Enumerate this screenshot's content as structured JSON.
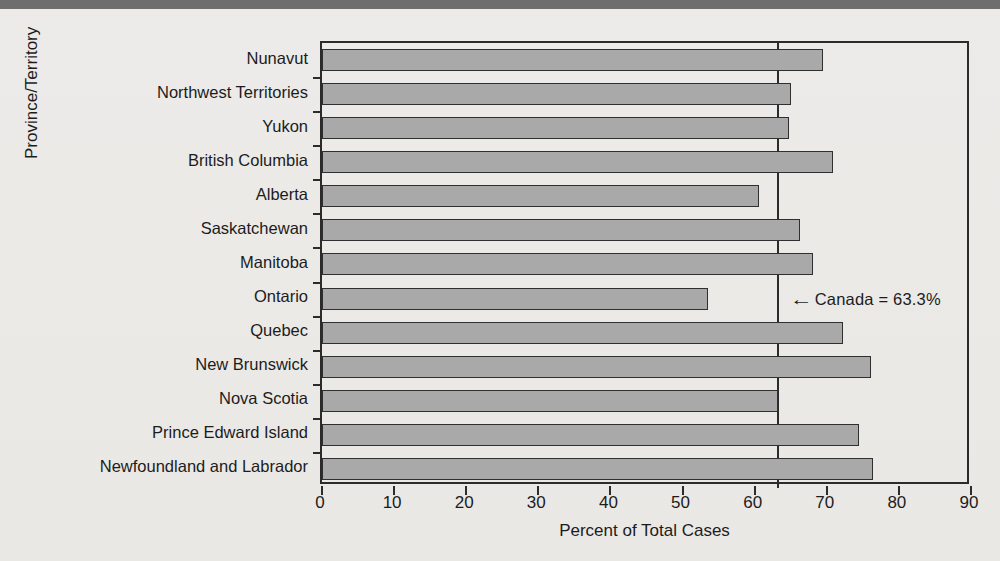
{
  "chart_data": {
    "type": "bar",
    "orientation": "horizontal",
    "title": "",
    "xlabel": "Percent of Total Cases",
    "ylabel": "Province/Territory",
    "xlim": [
      0,
      90
    ],
    "xticks": [
      0,
      10,
      20,
      30,
      40,
      50,
      60,
      70,
      80,
      90
    ],
    "grid": false,
    "legend": null,
    "categories": [
      "Nunavut",
      "Northwest Territories",
      "Yukon",
      "British Columbia",
      "Alberta",
      "Saskatchewan",
      "Manitoba",
      "Ontario",
      "Quebec",
      "New Brunswick",
      "Nova Scotia",
      "Prince Edward Island",
      "Newfoundland and Labrador"
    ],
    "values": [
      69.5,
      65.0,
      64.7,
      70.9,
      60.6,
      66.3,
      68.1,
      53.5,
      72.3,
      76.2,
      63.2,
      74.4,
      76.4
    ],
    "reference_line": {
      "value": 63.3,
      "label": "Canada = 63.3%",
      "arrow": "←"
    },
    "bar_fill_color": "#a9a9a9",
    "bar_edge_color": "#2f2f2f",
    "background_color": "#edebe9"
  },
  "axis": {
    "x_title": "Percent of Total Cases",
    "y_title": "Province/Territory",
    "x_tick_labels": [
      "0",
      "10",
      "20",
      "30",
      "40",
      "50",
      "60",
      "70",
      "80",
      "90"
    ]
  },
  "annotation": {
    "arrow_glyph": "←",
    "text": "Canada = 63.3%"
  }
}
